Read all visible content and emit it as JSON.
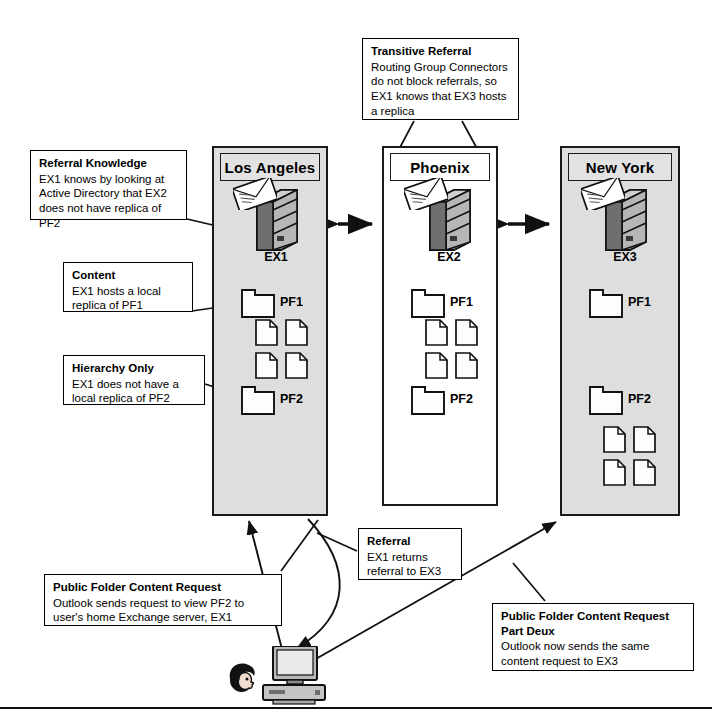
{
  "diagram": {
    "accent_shaded": "#dedede",
    "accent_line": "#1a1a1a"
  },
  "sites": [
    {
      "name": "Los Angeles",
      "server": "EX1",
      "shaded": true,
      "folders": [
        {
          "label": "PF1",
          "docs": 4
        },
        {
          "label": "PF2",
          "docs": 0
        }
      ]
    },
    {
      "name": "Phoenix",
      "server": "EX2",
      "shaded": false,
      "folders": [
        {
          "label": "PF1",
          "docs": 4
        },
        {
          "label": "PF2",
          "docs": 0
        }
      ]
    },
    {
      "name": "New York",
      "server": "EX3",
      "shaded": true,
      "folders": [
        {
          "label": "PF1",
          "docs": 0
        },
        {
          "label": "PF2",
          "docs": 4
        }
      ]
    }
  ],
  "callouts": {
    "transitive_referral": {
      "title": "Transitive Referral",
      "body": "Routing Group Connectors do not block referrals, so EX1 knows that EX3 hosts a replica"
    },
    "referral_knowledge": {
      "title": "Referral Knowledge",
      "body": "EX1 knows by looking at Active Directory that EX2 does not have replica of PF2"
    },
    "content": {
      "title": "Content",
      "body": "EX1 hosts a local replica of PF1"
    },
    "hierarchy_only": {
      "title": "Hierarchy Only",
      "body": "EX1 does not have a local replica of PF2"
    },
    "referral": {
      "title": "Referral",
      "body": "EX1 returns referral to EX3"
    },
    "content_request": {
      "title": "Public Folder Content Request",
      "body": "Outlook sends request to view PF2 to user's home Exchange server, EX1"
    },
    "content_request_2": {
      "title": "Public Folder Content Request Part Deux",
      "body": "Outlook now sends the same content request to EX3"
    }
  },
  "icons": {
    "server": "server-tower-icon",
    "mail": "envelope-icon",
    "folder": "folder-icon",
    "document": "document-icon",
    "workstation": "desktop-computer-icon",
    "user": "user-head-icon"
  }
}
